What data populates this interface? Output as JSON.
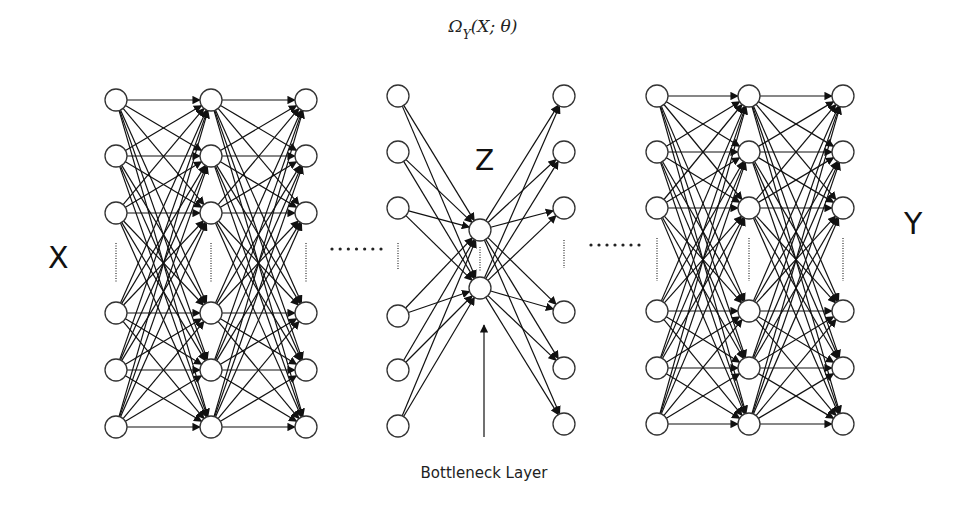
{
  "diagram": {
    "title_parts": {
      "omega": "Ω",
      "sub": "Y",
      "args": "(X; θ)"
    },
    "input_label": "X",
    "output_label": "Y",
    "latent_label": "Z",
    "bottleneck_caption": "Bottleneck Layer",
    "colors": {
      "stroke": "#111111",
      "node_fill": "#ffffff",
      "background": "#ffffff"
    },
    "layers": {
      "encoder_block": {
        "columns_x": [
          116,
          211,
          306
        ],
        "rows_y": [
          100,
          156,
          213,
          313,
          370,
          427
        ],
        "fully_connected": true
      },
      "middle_left": {
        "column_x": 398,
        "rows_y": [
          96,
          152,
          208,
          316,
          370,
          426
        ]
      },
      "bottleneck": {
        "column_x": 480,
        "rows_y": [
          230,
          288
        ]
      },
      "middle_right": {
        "column_x": 564,
        "rows_y": [
          96,
          152,
          208,
          312,
          368,
          424
        ]
      },
      "decoder_block": {
        "columns_x": [
          657,
          749,
          843
        ],
        "rows_y": [
          96,
          152,
          208,
          311,
          368,
          424
        ],
        "fully_connected": true
      }
    },
    "node_radius": 11,
    "ellipsis_left": {
      "x_start": 332,
      "x_end": 381,
      "y": 249,
      "count": 7
    },
    "ellipsis_right": {
      "x_start": 591,
      "x_end": 639,
      "y": 245,
      "count": 7
    },
    "bottleneck_arrow": {
      "x": 484,
      "y_start": 437,
      "y_end": 325
    }
  }
}
